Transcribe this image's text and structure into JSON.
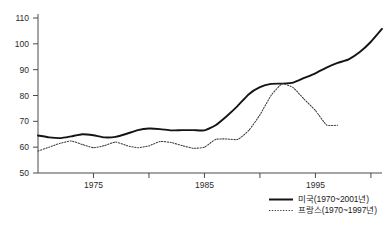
{
  "chart_data": {
    "type": "line",
    "title": "",
    "subtitle": "",
    "xlabel": "",
    "ylabel": "",
    "xlim": [
      1970,
      2001
    ],
    "ylim": [
      50,
      110
    ],
    "grid": false,
    "legend_position": "bottom-right",
    "y_ticks": [
      50,
      60,
      70,
      80,
      90,
      100,
      110
    ],
    "y_tick_labels": [
      "50",
      "60",
      "70",
      "80",
      "90",
      "100",
      "110"
    ],
    "x_ticks": [
      1975,
      1980,
      1985,
      1990,
      1995,
      2000
    ],
    "x_tick_labels": [
      "1975",
      "",
      "1985",
      "",
      "1995",
      ""
    ],
    "x_visible_tick_labels": [
      "1975",
      "1985",
      "1995"
    ],
    "series": [
      {
        "name": "미국(1970~2001년)",
        "style": "solid",
        "color": "#141414",
        "x": [
          1970,
          1971,
          1972,
          1973,
          1974,
          1975,
          1976,
          1977,
          1978,
          1979,
          1980,
          1981,
          1982,
          1983,
          1984,
          1985,
          1986,
          1987,
          1988,
          1989,
          1990,
          1991,
          1992,
          1993,
          1994,
          1995,
          1996,
          1997,
          1998,
          1999,
          2000,
          2001
        ],
        "values": [
          64.5,
          63.8,
          63.5,
          64.2,
          65.0,
          64.6,
          63.8,
          64.0,
          65.2,
          66.6,
          67.2,
          67.0,
          66.5,
          66.6,
          66.6,
          66.5,
          68.5,
          72.0,
          76.0,
          80.5,
          83.2,
          84.5,
          84.6,
          85.0,
          86.8,
          88.6,
          90.8,
          92.6,
          94.0,
          96.8,
          100.8,
          105.8
        ]
      },
      {
        "name": "프랑스(1970~1997년)",
        "style": "dotted",
        "color": "#3c3c3c",
        "x": [
          1970,
          1971,
          1972,
          1973,
          1974,
          1975,
          1976,
          1977,
          1978,
          1979,
          1980,
          1981,
          1982,
          1983,
          1984,
          1985,
          1986,
          1987,
          1988,
          1989,
          1990,
          1991,
          1992,
          1993,
          1994,
          1995,
          1996,
          1997
        ],
        "values": [
          58.5,
          60.0,
          61.5,
          62.4,
          61.0,
          59.8,
          60.6,
          62.0,
          60.6,
          59.8,
          60.5,
          62.2,
          61.8,
          60.6,
          59.6,
          60.0,
          63.0,
          63.2,
          63.0,
          66.5,
          72.5,
          80.0,
          84.5,
          83.0,
          78.5,
          74.2,
          68.6,
          68.5
        ]
      }
    ]
  },
  "legend": {
    "entries": [
      {
        "label": "미국(1970~2001년)",
        "style": "solid"
      },
      {
        "label": "프랑스(1970~1997년)",
        "style": "dotted"
      }
    ]
  },
  "axes": {
    "y_axis_name": "y-axis",
    "x_axis_name": "x-axis"
  }
}
